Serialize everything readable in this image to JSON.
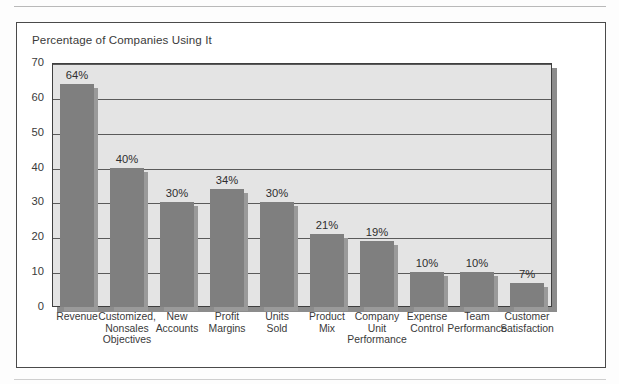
{
  "chart_data": {
    "type": "bar",
    "title": "Percentage of Companies Using It",
    "xlabel": "",
    "ylabel": "",
    "ylim": [
      0,
      70
    ],
    "yticks": [
      0,
      10,
      20,
      30,
      40,
      50,
      60,
      70
    ],
    "grid": true,
    "legend": "none",
    "orientation": "vertical",
    "value_label_suffix": "%",
    "categories": [
      "Revenue",
      "Customized, Nonsales Objectives",
      "New Accounts",
      "Profit Margins",
      "Units Sold",
      "Product Mix",
      "Company Unit Performance",
      "Expense Control",
      "Team Performance",
      "Customer Satisfaction"
    ],
    "category_lines": [
      [
        "Revenue"
      ],
      [
        "Customized,",
        "Nonsales",
        "Objectives"
      ],
      [
        "New",
        "Accounts"
      ],
      [
        "Profit",
        "Margins"
      ],
      [
        "Units",
        "Sold"
      ],
      [
        "Product",
        "Mix"
      ],
      [
        "Company",
        "Unit",
        "Performance"
      ],
      [
        "Expense",
        "Control"
      ],
      [
        "Team",
        "Performance"
      ],
      [
        "Customer",
        "Satisfaction"
      ]
    ],
    "values": [
      64,
      40,
      30,
      34,
      30,
      21,
      19,
      10,
      10,
      7
    ],
    "value_labels": [
      "64%",
      "40%",
      "30%",
      "34%",
      "30%",
      "21%",
      "19%",
      "10%",
      "10%",
      "7%"
    ],
    "colors": {
      "bar": "#7f7f7f",
      "bar_shadow": "#9a9a9a",
      "plot_background": "#e4e4e4",
      "plot_border": "#3f3f3f",
      "gridline": "#5a5a5a",
      "frame": "#4a4a4a",
      "text": "#3a3a3a",
      "page_background": "#fdfdfd"
    }
  }
}
